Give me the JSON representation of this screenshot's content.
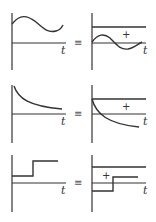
{
  "diagram": {
    "stroke_color": "#333333",
    "axis_label": "t",
    "equiv_symbol": "≡",
    "plus_symbol": "+",
    "rows": [
      {
        "name": "sinusoid-row",
        "left": {
          "axis": {
            "x": 12,
            "y_top": 13,
            "y_bottom": 70,
            "baseline_y": 43,
            "x_end": 66
          },
          "curve_type": "sine",
          "curve": "M12,24 C20,14 27,15 36,22 C44,29 48,33 56,31 C60,30 62,27 63,25",
          "t_label": {
            "x": 61,
            "y": 54
          }
        },
        "equiv": {
          "x": 74,
          "y": 46
        },
        "right": {
          "axis": {
            "x": 92,
            "y_top": 13,
            "y_bottom": 70,
            "baseline_y": 43,
            "x_end": 146
          },
          "dc_line_y": 27,
          "curve": "M92,42 C98,34 104,33 110,38 C116,44 120,50 128,49 C134,48 138,44 142,42",
          "plus": {
            "x": 122,
            "y": 38
          },
          "t_label": {
            "x": 143,
            "y": 54
          }
        }
      },
      {
        "name": "decay-row",
        "left": {
          "axis": {
            "x": 12,
            "y_top": 85,
            "y_bottom": 143,
            "baseline_y": 114,
            "x_end": 66
          },
          "curve_type": "decay",
          "curve": "M14,86 C18,98 28,106 62,109",
          "t_label": {
            "x": 61,
            "y": 125
          }
        },
        "equiv": {
          "x": 74,
          "y": 117
        },
        "right": {
          "axis": {
            "x": 92,
            "y_top": 85,
            "y_bottom": 143,
            "baseline_y": 114,
            "x_end": 146
          },
          "dc_line_y": 99,
          "curve": "M92,99 C96,114 108,124 139,127",
          "plus": {
            "x": 122,
            "y": 110
          },
          "t_label": {
            "x": 143,
            "y": 125
          }
        }
      },
      {
        "name": "step-row",
        "left": {
          "axis": {
            "x": 12,
            "y_top": 155,
            "y_bottom": 212,
            "baseline_y": 183,
            "x_end": 66
          },
          "curve_type": "step",
          "curve": "M12,176 L33,176 L33,161 L58,161",
          "t_label": {
            "x": 61,
            "y": 194
          }
        },
        "equiv": {
          "x": 74,
          "y": 186
        },
        "right": {
          "axis": {
            "x": 92,
            "y_top": 155,
            "y_bottom": 212,
            "baseline_y": 183,
            "x_end": 146
          },
          "dc_line_y": 167,
          "curve": "M92,191 L113,191 L113,177 L138,177",
          "plus": {
            "x": 102,
            "y": 179
          },
          "t_label": {
            "x": 143,
            "y": 194
          }
        }
      }
    ]
  }
}
